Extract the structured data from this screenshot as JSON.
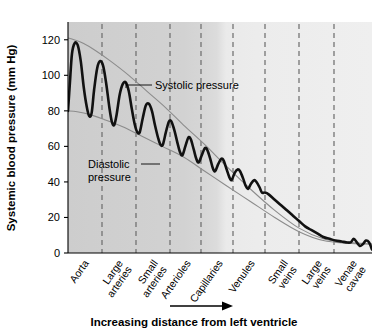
{
  "chart_data": {
    "type": "line",
    "title": "",
    "xlabel": "Increasing distance from left ventricle",
    "ylabel": "Systemic blood pressure (mm Hg)",
    "ylim": [
      0,
      130
    ],
    "yticks": [
      0,
      20,
      40,
      60,
      80,
      100,
      120
    ],
    "ytick_labels": [
      "0",
      "20",
      "40",
      "60",
      "80",
      "100",
      "120"
    ],
    "grid": false,
    "legend_position": "none",
    "categories": [
      "Aorta",
      "Large arteries",
      "Small arteries",
      "Arterioles",
      "Capillaries",
      "Venules",
      "Small veins",
      "Large veins",
      "Venae cavae"
    ],
    "category_lines": [
      [
        "Aorta"
      ],
      [
        "Large",
        "arteries"
      ],
      [
        "Small",
        "arteries"
      ],
      [
        "Arterioles"
      ],
      [
        "Capillaries"
      ],
      [
        "Venules"
      ],
      [
        "Small",
        "veins"
      ],
      [
        "Large",
        "veins"
      ],
      [
        "Venae",
        "cavae"
      ]
    ],
    "series": [
      {
        "name": "Systolic pressure",
        "role": "upper-envelope",
        "x": [
          0,
          2,
          5,
          9,
          14,
          20,
          26,
          32,
          38,
          45,
          52,
          60,
          68,
          76,
          84,
          92,
          100
        ],
        "values": [
          121,
          120,
          118,
          114,
          108,
          100,
          91,
          82,
          72,
          61,
          49,
          36,
          24,
          14,
          8,
          6,
          5
        ]
      },
      {
        "name": "Diastolic pressure",
        "role": "lower-envelope",
        "x": [
          0,
          3,
          7,
          12,
          18,
          24,
          31,
          38,
          45,
          52,
          60,
          68,
          76,
          84,
          92,
          100
        ],
        "values": [
          80,
          79.5,
          78,
          75,
          71,
          66,
          60,
          54,
          46,
          38,
          29,
          20,
          12,
          7,
          5.5,
          5
        ]
      },
      {
        "name": "Pulsatile blood pressure",
        "role": "pressure-trace",
        "points": [
          [
            0.0,
            80
          ],
          [
            0.6,
            95
          ],
          [
            1.3,
            112
          ],
          [
            2.2,
            118
          ],
          [
            3.2,
            117
          ],
          [
            4.2,
            108
          ],
          [
            5.2,
            93
          ],
          [
            6.2,
            82
          ],
          [
            7.0,
            77
          ],
          [
            7.8,
            79
          ],
          [
            8.6,
            92
          ],
          [
            9.6,
            104
          ],
          [
            10.6,
            108
          ],
          [
            11.6,
            105
          ],
          [
            12.6,
            95
          ],
          [
            13.6,
            82
          ],
          [
            14.4,
            74
          ],
          [
            15.2,
            72
          ],
          [
            16.0,
            78
          ],
          [
            17.0,
            89
          ],
          [
            18.0,
            95
          ],
          [
            19.0,
            96
          ],
          [
            20.0,
            91
          ],
          [
            21.0,
            81
          ],
          [
            22.0,
            72
          ],
          [
            22.8,
            68
          ],
          [
            23.6,
            68
          ],
          [
            24.6,
            76
          ],
          [
            25.6,
            83
          ],
          [
            26.6,
            84
          ],
          [
            27.6,
            80
          ],
          [
            28.6,
            72
          ],
          [
            29.6,
            65
          ],
          [
            30.4,
            61
          ],
          [
            31.2,
            61
          ],
          [
            32.2,
            68
          ],
          [
            33.2,
            74
          ],
          [
            34.0,
            74
          ],
          [
            35.0,
            69
          ],
          [
            36.0,
            62
          ],
          [
            36.8,
            57
          ],
          [
            37.6,
            55
          ],
          [
            38.6,
            60
          ],
          [
            39.6,
            65
          ],
          [
            40.4,
            64
          ],
          [
            41.4,
            58
          ],
          [
            42.2,
            53
          ],
          [
            43.0,
            51
          ],
          [
            44.0,
            55
          ],
          [
            45.0,
            59
          ],
          [
            45.8,
            58
          ],
          [
            46.8,
            53
          ],
          [
            47.6,
            48
          ],
          [
            48.4,
            46
          ],
          [
            49.4,
            50
          ],
          [
            50.4,
            53
          ],
          [
            51.2,
            52
          ],
          [
            52.2,
            47
          ],
          [
            53.0,
            43
          ],
          [
            53.8,
            41
          ],
          [
            54.8,
            45
          ],
          [
            55.8,
            47
          ],
          [
            56.6,
            46
          ],
          [
            57.6,
            42
          ],
          [
            58.4,
            38
          ],
          [
            59.2,
            36
          ],
          [
            60.2,
            39
          ],
          [
            61.2,
            41
          ],
          [
            62.0,
            40
          ],
          [
            63.0,
            37
          ],
          [
            63.8,
            34
          ],
          [
            64.8,
            34
          ],
          [
            66.0,
            33
          ],
          [
            68.0,
            30
          ],
          [
            70.0,
            27
          ],
          [
            72.0,
            24
          ],
          [
            74.0,
            21
          ],
          [
            76.0,
            18
          ],
          [
            78.0,
            15
          ],
          [
            80.0,
            13
          ],
          [
            82.0,
            11
          ],
          [
            84.0,
            9
          ],
          [
            86.0,
            8
          ],
          [
            88.0,
            7
          ],
          [
            90.0,
            6.5
          ],
          [
            91.5,
            6
          ],
          [
            93.0,
            6
          ],
          [
            94.0,
            8
          ],
          [
            95.0,
            6
          ],
          [
            96.0,
            4
          ],
          [
            97.0,
            5
          ],
          [
            98.0,
            7
          ],
          [
            99.0,
            6
          ],
          [
            100.0,
            2
          ]
        ]
      }
    ],
    "annotations": [
      {
        "name": "systolic-pressure-label",
        "text": "Systolic pressure",
        "lines": [
          "Systolic pressure"
        ]
      },
      {
        "name": "diastolic-pressure-label",
        "text": "Diastolic pressure",
        "lines": [
          "Diastolic",
          "pressure"
        ]
      }
    ],
    "background_bands": [
      {
        "name": "arterial-band",
        "shade": "#cfcfcf"
      },
      {
        "name": "venous-band",
        "shade": "#ebebeb"
      }
    ],
    "colors": {
      "trace": "#111111",
      "envelope": "#8c8c8c",
      "divider": "#6b6b6b",
      "arterial_band": "#cfcfcf",
      "venous_band": "#ebebeb",
      "axis": "#000000",
      "text": "#000000"
    }
  }
}
